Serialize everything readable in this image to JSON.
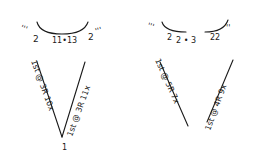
{
  "diagrams": [
    {
      "id": "left",
      "top": {
        "left_ticks": "'''",
        "left_num": "2",
        "center": "11•13",
        "right_num": "2",
        "right_ticks": "'''"
      },
      "left_arm": "1st @ 3R 10x",
      "right_arm": "1st @ 3R 11x",
      "bottom": "1"
    },
    {
      "id": "right",
      "top": {
        "left_ticks": "'''",
        "left_num": "2",
        "center": "2 • 3",
        "right_num": "22",
        "right_ticks": "''"
      },
      "left_arm": "1st @ 5R 7x",
      "right_arm": "1st @ 4R 9x",
      "bottom": "1"
    }
  ]
}
